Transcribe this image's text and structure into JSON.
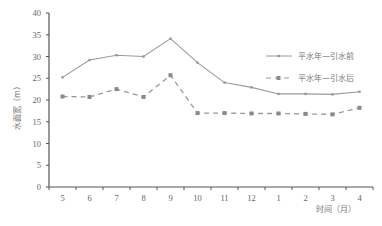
{
  "chart_data": {
    "type": "line",
    "title": "",
    "xlabel": "时间（月）",
    "ylabel": "水面宽（m）",
    "categories": [
      "5",
      "6",
      "7",
      "8",
      "9",
      "10",
      "11",
      "12",
      "1",
      "2",
      "3",
      "4"
    ],
    "ylim": [
      0,
      40
    ],
    "yticks": [
      0,
      5,
      10,
      15,
      20,
      25,
      30,
      35,
      40
    ],
    "grid": false,
    "legend_position": "right",
    "series": [
      {
        "name": "平水年—引水前",
        "style": "solid",
        "marker": "small-dot",
        "color": "#9a9a9a",
        "values": [
          25.2,
          29.2,
          30.3,
          30.0,
          34.1,
          28.6,
          24.0,
          22.9,
          21.4,
          21.4,
          21.3,
          21.9
        ]
      },
      {
        "name": "平水年—引水后",
        "style": "dashed",
        "marker": "square",
        "color": "#9a9a9a",
        "values": [
          20.8,
          20.7,
          22.5,
          20.7,
          25.7,
          17.0,
          17.0,
          16.9,
          16.9,
          16.8,
          16.7,
          18.2
        ]
      }
    ]
  }
}
